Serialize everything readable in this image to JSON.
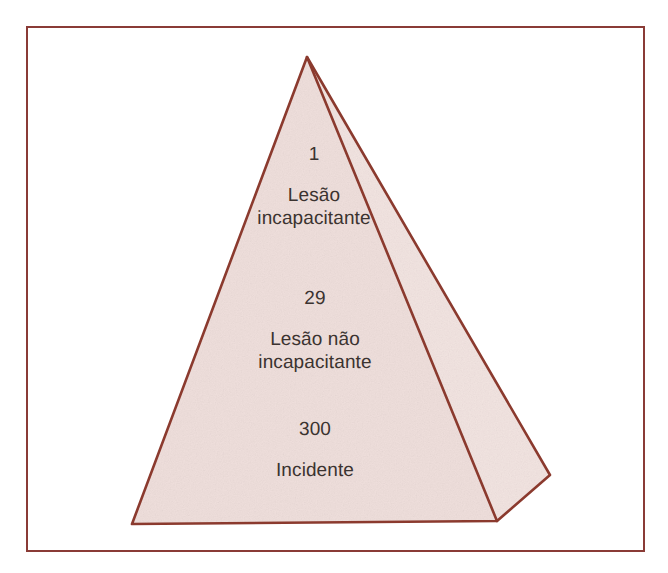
{
  "figure": {
    "kind": "pyramid-diagram",
    "language": "pt-BR",
    "frame": {
      "border_color": "#8a3b36",
      "background_color": "#ffffff"
    },
    "pyramid": {
      "outline_color": "#8b3a2e",
      "front_face_fill": "#efdfdc",
      "side_face_fill": "#f2e4e1",
      "apex": {
        "x": 307,
        "y": 57
      },
      "base_left": {
        "x": 132,
        "y": 524
      },
      "base_right": {
        "x": 497,
        "y": 521
      },
      "side_outer": {
        "x": 550,
        "y": 475
      }
    },
    "tiers": [
      {
        "id": "top",
        "value": "1",
        "label": "Lesão\nincapacitante"
      },
      {
        "id": "middle",
        "value": "29",
        "label": "Lesão não\nincapacitante"
      },
      {
        "id": "bottom",
        "value": "300",
        "label": "Incidente"
      }
    ]
  }
}
